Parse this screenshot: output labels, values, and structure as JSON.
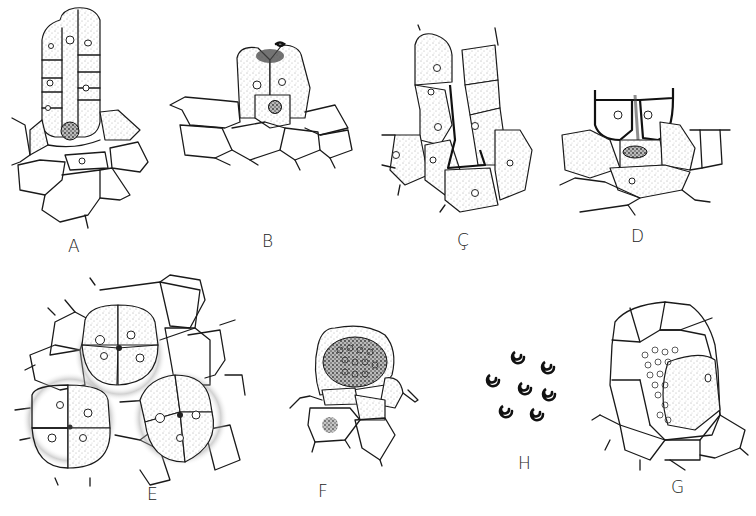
{
  "figure": {
    "type": "scientific-illustration",
    "style": "black ink line drawing with stippling, white background",
    "panels": [
      {
        "id": "A",
        "label": "A",
        "description": "Elongated multicellular structure with two columns of stippled cells rising from parenchyma tissue; dense central basal cell"
      },
      {
        "id": "B",
        "label": "B",
        "description": "Pair of stippled cells opening at top with dark secretion, central cell with dense nucleus, over row of parenchyma cells"
      },
      {
        "id": "C",
        "label": "Ç",
        "description": "Two columns of stippled cells with thick-walled channel between them over basal tissue"
      },
      {
        "id": "D",
        "label": "D",
        "description": "Two thick-walled apical cells with dark slit between, central cell with elongated nucleus, surrounding stippled tissue"
      },
      {
        "id": "E",
        "label": "E",
        "description": "Three four-celled clusters (tetrads) surrounded by stippled halo within polygonal epidermal cells"
      },
      {
        "id": "F",
        "label": "F",
        "description": "Dome-shaped structure containing dense mass of many small cells, adjacent cell with dark stippled nucleus"
      },
      {
        "id": "H",
        "label": "H",
        "description": "Seven isolated dark spiral-coiled bodies"
      },
      {
        "id": "G",
        "label": "G",
        "description": "Rounded chamber surrounded by wall cells, filled with many coiled filaments; one large lateral cell with nucleus"
      }
    ]
  },
  "colors": {
    "background": "#ffffff",
    "ink": "#1a1a1a"
  }
}
